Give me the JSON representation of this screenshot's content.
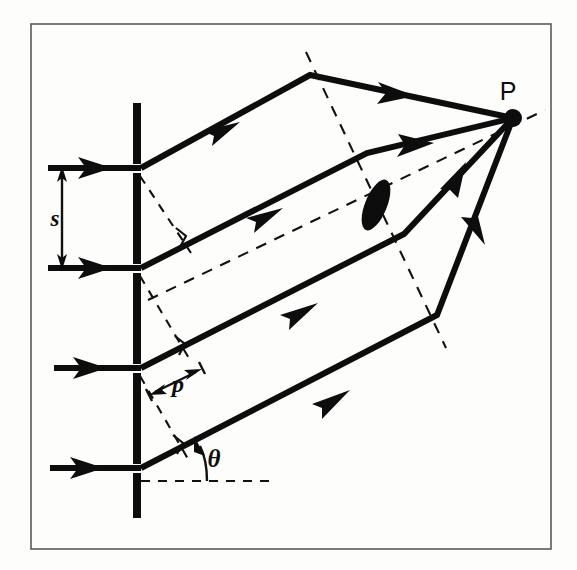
{
  "figure": {
    "background_color": "#fdfdfc",
    "ink_color": "#0d0d0d",
    "frame_color": "#5a5a5a"
  },
  "labels": {
    "slit_separation": "s",
    "path_difference": "p",
    "diffraction_angle": "θ",
    "focal_point": "P"
  },
  "components": {
    "grating_name": "diffraction-grating",
    "lens_name": "converging-lens",
    "screen_point_name": "focal-point-P",
    "incident_rays_count": 4,
    "diffracted_rays_count": 4
  },
  "geometry": {
    "frame": {
      "x": 31,
      "y": 24,
      "width": 520,
      "height": 525
    },
    "grating": {
      "x": 133,
      "width": 8,
      "top": 103,
      "bottom": 518,
      "slit_positions": [
        168,
        268,
        368,
        468
      ],
      "slit_gap": 9
    },
    "incident_rays": [
      {
        "y": 168,
        "x_start": 48,
        "x_end": 141
      },
      {
        "y": 268,
        "x_start": 48,
        "x_end": 141
      },
      {
        "y": 368,
        "x_start": 54,
        "x_end": 141
      },
      {
        "y": 468,
        "x_start": 50,
        "x_end": 141
      }
    ],
    "point_p": {
      "x": 513,
      "y": 118,
      "radius": 9
    },
    "diffracted_rays": [
      {
        "from_slit": 168,
        "bend_x": 310,
        "bend_y": 75
      },
      {
        "from_slit": 268,
        "bend_x": 367,
        "bend_y": 153
      },
      {
        "from_slit": 368,
        "bend_x": 404,
        "bend_y": 234
      },
      {
        "from_slit": 468,
        "bend_x": 437,
        "bend_y": 315
      }
    ],
    "lens_plane_dashed": {
      "x1": 306,
      "y1": 52,
      "x2": 446,
      "y2": 348
    },
    "optical_axis_dashed": {
      "x1": 148,
      "y1": 300,
      "x2": 545,
      "y2": 110
    },
    "theta_baseline_dashed": {
      "x1": 141,
      "y1": 481,
      "x2": 277,
      "y2": 481
    },
    "lens": {
      "cx": 376,
      "cy": 205,
      "rx": 11,
      "ry": 27,
      "rotation": 22
    },
    "s_dimension": {
      "x": 62,
      "y_top": 168,
      "y_bottom": 268
    },
    "p_dimension": {
      "x1": 152,
      "y1": 394,
      "x2": 198,
      "y2": 371
    },
    "right_angle_markers": [
      {
        "x": 181,
        "y": 237
      },
      {
        "x": 180,
        "y": 345
      },
      {
        "x": 178,
        "y": 444
      }
    ],
    "label_positions": {
      "s": {
        "x": 55,
        "y": 226
      },
      "p": {
        "x": 178,
        "y": 389
      },
      "theta": {
        "x": 213,
        "y": 465
      },
      "P": {
        "x": 508,
        "y": 98
      }
    }
  }
}
